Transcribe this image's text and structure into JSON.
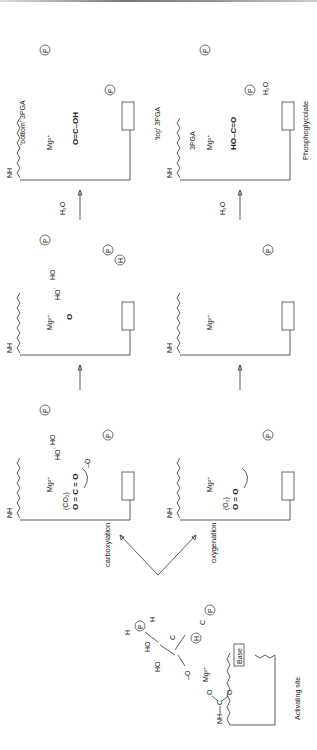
{
  "diagram": {
    "labels": {
      "activating_site": "Activating site",
      "base": "Base",
      "carboxylation": "carboxylation",
      "oxygenation": "oxygenation",
      "co2": "(CO₂)",
      "o2": "(O₂)",
      "co2_formula": "O = C = O",
      "o2_formula": "O = O",
      "mg": "Mg²⁺",
      "water1": "H₂O",
      "water2": "H₂O",
      "water3": "H₂O",
      "bottom_3pga": "'bottom' 3PGA",
      "top_3pga": "'top' 3PGA",
      "product_3pga": "3PGA",
      "phosphoglycolate": "Phosphoglycolate",
      "p": "P",
      "h": "H",
      "nh": "NH",
      "c": "C",
      "o": "O",
      "ho": "HO",
      "hostar": "HO˙",
      "ominus": "–O",
      "occoh": "O=C–OH",
      "hoco": "HO–C=O"
    },
    "panels": [
      {
        "id": "activating-site",
        "step": "enediol intermediate"
      },
      {
        "id": "carboxylation-1",
        "step": "CO2 addition"
      },
      {
        "id": "carboxylation-2",
        "step": "hydration"
      },
      {
        "id": "carboxylation-3",
        "step": "2 x 3PGA"
      },
      {
        "id": "oxygenation-1",
        "step": "O2 addition"
      },
      {
        "id": "oxygenation-2",
        "step": "hydration"
      },
      {
        "id": "oxygenation-3",
        "step": "3PGA + Phosphoglycolate"
      }
    ]
  }
}
